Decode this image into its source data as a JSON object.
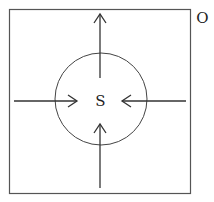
{
  "diagram": {
    "outer_label": "O",
    "center_label": "S",
    "colors": {
      "stroke": "#333333",
      "box_stroke": "#555555",
      "circle_stroke": "#444444",
      "text": "#222222"
    },
    "box": {
      "x": 9,
      "y": 9,
      "width": 182,
      "height": 185
    },
    "circle": {
      "cx": 101,
      "cy": 99,
      "r": 46
    },
    "arrows": [
      {
        "name": "top-arrow",
        "direction": "up",
        "from": [
          100,
          78
        ],
        "to": [
          100,
          14
        ]
      },
      {
        "name": "bottom-arrow",
        "direction": "up",
        "from": [
          100,
          188
        ],
        "to": [
          100,
          124
        ]
      },
      {
        "name": "left-arrow",
        "direction": "right",
        "from": [
          14,
          101
        ],
        "to": [
          77,
          101
        ]
      },
      {
        "name": "right-arrow",
        "direction": "left",
        "from": [
          186,
          101
        ],
        "to": [
          122,
          101
        ]
      }
    ]
  }
}
